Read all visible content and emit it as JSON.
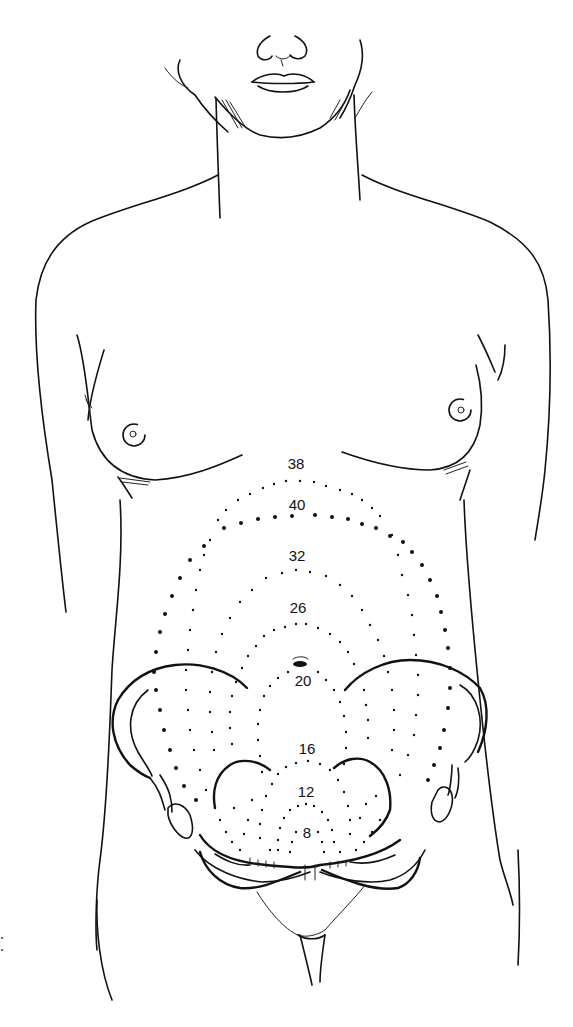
{
  "figure": {
    "labels": [
      {
        "id": "w38",
        "text": "38",
        "x": 296,
        "y": 469
      },
      {
        "id": "w40",
        "text": "40",
        "x": 297,
        "y": 510
      },
      {
        "id": "w32",
        "text": "32",
        "x": 297,
        "y": 561
      },
      {
        "id": "w26",
        "text": "26",
        "x": 298,
        "y": 613
      },
      {
        "id": "w20",
        "text": "20",
        "x": 303,
        "y": 686
      },
      {
        "id": "w16",
        "text": "16",
        "x": 307,
        "y": 754
      },
      {
        "id": "w12",
        "text": "12",
        "x": 306,
        "y": 797
      },
      {
        "id": "w8",
        "text": "8",
        "x": 307,
        "y": 838
      }
    ],
    "landmarks": {
      "umbilicus": "umbilicus-icon",
      "pelvis": "pelvis-outline",
      "breasts": "breast-outline"
    }
  }
}
